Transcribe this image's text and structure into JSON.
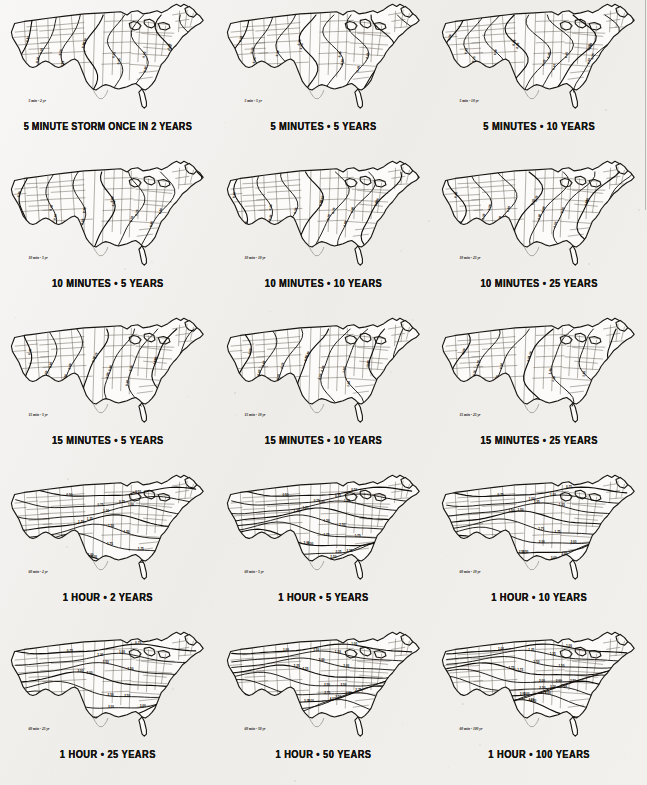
{
  "page": {
    "background_color": "#efeeec",
    "ink_color": "#15130f",
    "grid_rows": 5,
    "grid_cols": 3
  },
  "panels": [
    {
      "id": "p1",
      "caption": "5 MINUTE STORM ONCE IN 2 YEARS",
      "inset_label": "5 min - 2 yr",
      "duration": "5 minutes",
      "return_period": "2 years",
      "contour_values": [
        "0.15",
        "0.20",
        "0.25",
        "0.30",
        "0.35",
        "0.40",
        "0.45",
        "0.50"
      ]
    },
    {
      "id": "p2",
      "caption": "5 MINUTES • 5 YEARS",
      "inset_label": "5 min - 5 yr",
      "duration": "5 minutes",
      "return_period": "5 years",
      "contour_values": [
        "0.20",
        "0.25",
        "0.30",
        "0.35",
        "0.40",
        "0.45",
        "0.50",
        "0.55"
      ]
    },
    {
      "id": "p3",
      "caption": "5 MINUTES • 10 YEARS",
      "inset_label": "5 min - 10 yr",
      "duration": "5 minutes",
      "return_period": "10 years",
      "contour_values": [
        "0.20",
        "0.25",
        "0.30",
        "0.35",
        "0.40",
        "0.45",
        "0.50",
        "0.55",
        "0.60"
      ]
    },
    {
      "id": "p4",
      "caption": "10 MINUTES • 5 YEARS",
      "inset_label": "10 min - 5 yr",
      "duration": "10 minutes",
      "return_period": "5 years",
      "contour_values": [
        "0.30",
        "0.40",
        "0.50",
        "0.60",
        "0.70",
        "0.80",
        "0.90"
      ]
    },
    {
      "id": "p5",
      "caption": "10 MINUTES • 10 YEARS",
      "inset_label": "10 min - 10 yr",
      "duration": "10 minutes",
      "return_period": "10 years",
      "contour_values": [
        "0.30",
        "0.40",
        "0.50",
        "0.60",
        "0.70",
        "0.80",
        "0.90",
        "1.00"
      ]
    },
    {
      "id": "p6",
      "caption": "10 MINUTES • 25 YEARS",
      "inset_label": "10 min - 25 yr",
      "duration": "10 minutes",
      "return_period": "25 years",
      "contour_values": [
        "0.40",
        "0.50",
        "0.60",
        "0.70",
        "0.80",
        "0.90",
        "1.00",
        "1.10"
      ]
    },
    {
      "id": "p7",
      "caption": "15 MINUTES • 5 YEARS",
      "inset_label": "15 min - 5 yr",
      "duration": "15 minutes",
      "return_period": "5 years",
      "contour_values": [
        "0.40",
        "0.50",
        "0.60",
        "0.70",
        "0.80",
        "0.90",
        "1.00",
        "1.10"
      ]
    },
    {
      "id": "p8",
      "caption": "15 MINUTES • 10 YEARS",
      "inset_label": "15 min - 10 yr",
      "duration": "15 minutes",
      "return_period": "10 years",
      "contour_values": [
        "0.50",
        "0.60",
        "0.70",
        "0.80",
        "0.90",
        "1.00",
        "1.20",
        "1.40"
      ]
    },
    {
      "id": "p9",
      "caption": "15 MINUTES • 25 YEARS",
      "inset_label": "15 min - 25 yr",
      "duration": "15 minutes",
      "return_period": "25 years",
      "contour_values": [
        "0.50",
        "0.70",
        "0.90",
        "1.10",
        "1.30",
        "1.50",
        "1.70"
      ]
    },
    {
      "id": "p10",
      "caption": "1 HOUR • 2 YEARS",
      "inset_label": "60 min - 2 yr",
      "duration": "1 hour",
      "return_period": "2 years",
      "contour_values": [
        "0.50",
        "0.75",
        "1.00",
        "1.25",
        "1.50",
        "1.75",
        "2.00"
      ]
    },
    {
      "id": "p11",
      "caption": "1 HOUR • 5 YEARS",
      "inset_label": "60 min - 5 yr",
      "duration": "1 hour",
      "return_period": "5 years",
      "contour_values": [
        "0.50",
        "0.75",
        "1.00",
        "1.25",
        "1.50",
        "1.75",
        "2.00",
        "2.25",
        "2.50"
      ]
    },
    {
      "id": "p12",
      "caption": "1 HOUR • 10 YEARS",
      "inset_label": "60 min - 10 yr",
      "duration": "1 hour",
      "return_period": "10 years",
      "contour_values": [
        "0.75",
        "1.00",
        "1.25",
        "1.50",
        "1.75",
        "2.00",
        "2.50",
        "3.00"
      ]
    },
    {
      "id": "p13",
      "caption": "1 HOUR • 25 YEARS",
      "inset_label": "60 min - 25 yr",
      "duration": "1 hour",
      "return_period": "25 years",
      "contour_values": [
        "0.75",
        "1.00",
        "1.50",
        "2.00",
        "2.50",
        "3.00",
        "3.50"
      ]
    },
    {
      "id": "p14",
      "caption": "1 HOUR • 50 YEARS",
      "inset_label": "60 min - 50 yr",
      "duration": "1 hour",
      "return_period": "50 years",
      "contour_values": [
        "1.00",
        "1.50",
        "2.00",
        "2.25",
        "2.50",
        "2.75",
        "3.00",
        "3.50",
        "4.00"
      ]
    },
    {
      "id": "p15",
      "caption": "1 HOUR • 100 YEARS",
      "inset_label": "60 min - 100 yr",
      "duration": "1 hour",
      "return_period": "100 years",
      "contour_values": [
        "1.00",
        "1.25",
        "1.50",
        "1.75",
        "2.00",
        "2.50",
        "3.00",
        "3.50",
        "4.00",
        "4.50"
      ]
    }
  ],
  "chart_data": {
    "type": "heatmap",
    "xlabel": "",
    "ylabel": "",
    "map_region": "Contiguous United States",
    "units": "inches of rainfall",
    "panel_captions": [
      "5 MINUTE STORM ONCE IN 2 YEARS",
      "5 MINUTES • 5 YEARS",
      "5 MINUTES • 10 YEARS",
      "10 MINUTES • 5 YEARS",
      "10 MINUTES • 10 YEARS",
      "10 MINUTES • 25 YEARS",
      "15 MINUTES • 5 YEARS",
      "15 MINUTES • 10 YEARS",
      "15 MINUTES • 25 YEARS",
      "1 HOUR • 2 YEARS",
      "1 HOUR • 5 YEARS",
      "1 HOUR • 10 YEARS",
      "1 HOUR • 25 YEARS",
      "1 HOUR • 50 YEARS",
      "1 HOUR • 100 YEARS"
    ],
    "durations": [
      "5 minutes",
      "10 minutes",
      "15 minutes",
      "1 hour"
    ],
    "return_periods": [
      "2 years",
      "5 years",
      "10 years",
      "25 years",
      "50 years",
      "100 years"
    ],
    "contour_ranges": {
      "5min": [
        0.15,
        0.6
      ],
      "10min": [
        0.3,
        1.1
      ],
      "15min": [
        0.4,
        1.7
      ],
      "60min": [
        0.5,
        4.5
      ]
    },
    "grid": "off",
    "legend": "none"
  }
}
